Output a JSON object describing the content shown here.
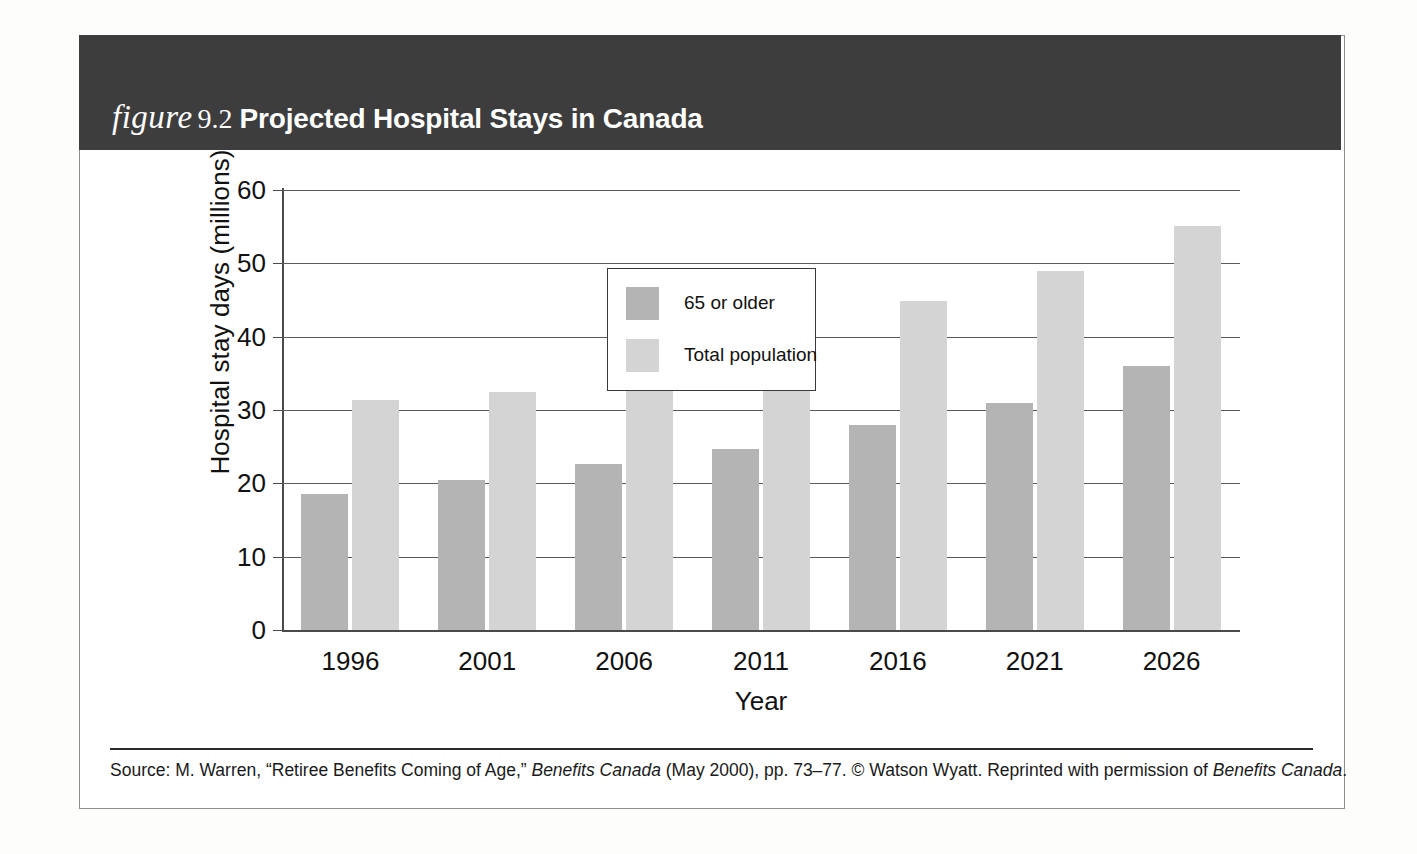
{
  "header": {
    "figure_word": "figure",
    "figure_number": "9.2",
    "title": "Projected Hospital Stays in Canada",
    "band_color": "#3d3d3d",
    "text_color": "#ffffff"
  },
  "legend": {
    "entries": [
      {
        "label": "65 or older",
        "color": "#b4b4b4",
        "swatch_name": "legend-swatch-senior"
      },
      {
        "label": "Total population",
        "color": "#d4d4d4",
        "swatch_name": "legend-swatch-total"
      }
    ]
  },
  "source": {
    "prefix": "Source: M. Warren, “Retiree Benefits Coming of Age,” ",
    "italic1": "Benefits Canada",
    "middle": " (May 2000), pp. 73–77. © Watson Wyatt. Reprinted with permission of ",
    "italic2": "Benefits Canada",
    "suffix": "."
  },
  "chart_data": {
    "type": "bar",
    "title": "Projected Hospital Stays in Canada",
    "xlabel": "Year",
    "ylabel": "Hospital stay days (millions)",
    "categories": [
      "1996",
      "2001",
      "2006",
      "2011",
      "2016",
      "2021",
      "2026"
    ],
    "series": [
      {
        "name": "65 or older",
        "color": "#b4b4b4",
        "values": [
          18.5,
          20.5,
          22.6,
          24.7,
          27.9,
          31.0,
          36.0
        ]
      },
      {
        "name": "Total population",
        "color": "#d4d4d4",
        "values": [
          31.4,
          32.4,
          36.6,
          42.8,
          44.9,
          48.9,
          55.1
        ]
      }
    ],
    "ylim": [
      0,
      60
    ],
    "yticks": [
      0,
      10,
      20,
      30,
      40,
      50,
      60
    ],
    "ytick_labels": [
      "0",
      "10",
      "20",
      "30",
      "40",
      "50",
      "60"
    ],
    "grid": true,
    "grid_axis": "y",
    "legend_position": "upper left (inside plot)"
  }
}
